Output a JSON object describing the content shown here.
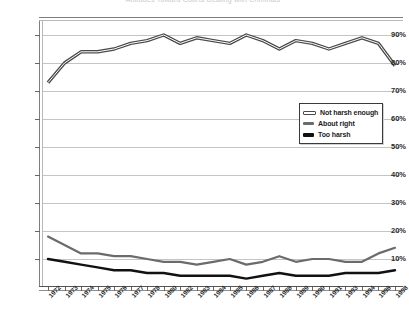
{
  "chart_data": {
    "type": "line",
    "title": "Attitudes Toward Courts Dealing with Criminals",
    "xlabel": "",
    "ylabel": "",
    "ylim": [
      0,
      95
    ],
    "yticks": [
      10,
      20,
      30,
      40,
      50,
      60,
      70,
      80,
      90
    ],
    "ytick_labels": [
      "10%",
      "20%",
      "30%",
      "40%",
      "50%",
      "60%",
      "70%",
      "80%",
      "90%"
    ],
    "grid": true,
    "legend_position": "center-right",
    "categories": [
      "1972",
      "1973",
      "1974",
      "1975",
      "1976",
      "1977",
      "1978",
      "1980",
      "1982",
      "1983",
      "1984",
      "1985",
      "1986",
      "1987",
      "1988",
      "1989",
      "1990",
      "1991",
      "1993",
      "1994",
      "1996",
      "1998"
    ],
    "series": [
      {
        "name": "Not harsh enough",
        "color": "#8c8c8c",
        "values": [
          73,
          80,
          84,
          84,
          85,
          87,
          88,
          90,
          87,
          89,
          88,
          87,
          90,
          88,
          85,
          88,
          87,
          85,
          87,
          89,
          87,
          79
        ]
      },
      {
        "name": "About right",
        "color": "#6b6b6b",
        "values": [
          18,
          15,
          12,
          12,
          11,
          11,
          10,
          9,
          9,
          8,
          9,
          10,
          8,
          9,
          11,
          9,
          10,
          10,
          9,
          9,
          12,
          14
        ]
      },
      {
        "name": "Too harsh",
        "color": "#111111",
        "values": [
          10,
          9,
          8,
          7,
          6,
          6,
          5,
          5,
          4,
          4,
          4,
          4,
          3,
          4,
          5,
          4,
          4,
          4,
          5,
          5,
          5,
          6
        ]
      }
    ]
  },
  "legend": {
    "items": [
      {
        "label": "Not harsh enough"
      },
      {
        "label": "About right"
      },
      {
        "label": "Too harsh"
      }
    ]
  }
}
